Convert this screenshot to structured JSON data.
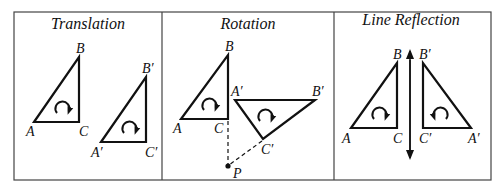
{
  "panels": [
    {
      "title": "Translation",
      "labels": {
        "A": "A",
        "B": "B",
        "C": "C",
        "A_prime": "A′",
        "B_prime": "B′",
        "C_prime": "C′"
      }
    },
    {
      "title": "Rotation",
      "labels": {
        "A": "A",
        "B": "B",
        "C": "C",
        "A_prime": "A′",
        "B_prime": "B′",
        "C_prime": "C′",
        "P": "P"
      }
    },
    {
      "title": "Line Reflection",
      "labels": {
        "A": "A",
        "B": "B",
        "C": "C",
        "A_prime": "A′",
        "B_prime": "B′",
        "C_prime": "C′"
      }
    }
  ]
}
